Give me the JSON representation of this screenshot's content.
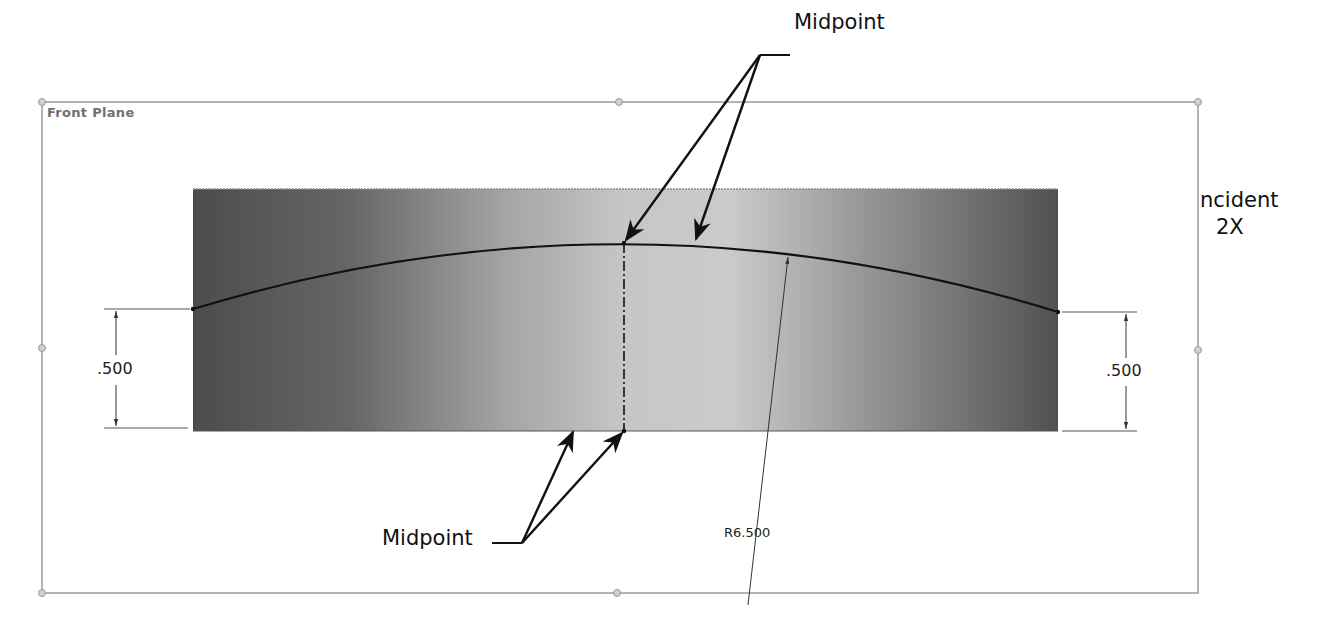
{
  "sketch": {
    "plane_name": "Front Plane",
    "colors": {
      "outline": "#9a9a9a",
      "handle": "#c8c8c8",
      "face_dark": "#4f4f4f",
      "face_light": "#c9c9c9",
      "geometry": "#111111",
      "dimension": "#333333"
    }
  },
  "annotations": {
    "top_callout": "Midpoint",
    "bottom_callout": "Midpoint",
    "coincident_line1": "ncident",
    "coincident_line2": "2X"
  },
  "dimensions": {
    "left_height": ".500",
    "right_height": ".500",
    "arc_radius": "R6.500"
  }
}
